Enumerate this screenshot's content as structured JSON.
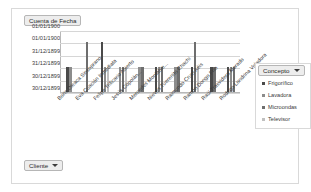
{
  "window": {
    "title_field_label": "Cuenta de Fecha",
    "cliente_field_label": "Cliente",
    "concepto_field_label": "Concepto"
  },
  "legend": {
    "title": "Concepto",
    "items": [
      {
        "label": "Frigorífico",
        "color": "#4a4a4a"
      },
      {
        "label": "Lavadora",
        "color": "#8c8c8c"
      },
      {
        "label": "Microondas",
        "color": "#6e6e6e"
      },
      {
        "label": "Televisor",
        "color": "#c0c0c0"
      }
    ]
  },
  "chart_data": {
    "type": "bar",
    "title": "Cuenta de Fecha",
    "xlabel": "Cliente",
    "ylabel": "Cuenta de Fecha",
    "grid": true,
    "legend_position": "right",
    "ytick_labels": [
      "01/01/1900",
      "01/01/1900",
      "31/12/1899",
      "31/12/1899",
      "30/12/1899",
      "30/12/1899"
    ],
    "ylim": [
      0,
      5
    ],
    "categories": [
      "Boris Oleaca Sinsoprano",
      "Eva Cuación Inmediata",
      "Felipe Trificario Abierto",
      "Jesús Copolán...",
      "Mercedes Montable...",
      "Nieves Tuerenito Chachi",
      "Raimundo Cruel Aéis",
      "Ramón Dongo Frío",
      "Raúl Trasvidera Morado",
      "Rodrigo Londrina Voladora"
    ],
    "series": [
      {
        "name": "Frigorífico",
        "color": "#4a4a4a",
        "values": [
          2,
          0,
          4,
          0,
          0,
          2,
          0,
          2,
          2,
          2
        ]
      },
      {
        "name": "Lavadora",
        "color": "#8c8c8c",
        "values": [
          2,
          0,
          2,
          2,
          2,
          2,
          2,
          0,
          0,
          2
        ]
      },
      {
        "name": "Microondas",
        "color": "#6e6e6e",
        "values": [
          0,
          4,
          0,
          2,
          2,
          2,
          2,
          4,
          2,
          2
        ]
      },
      {
        "name": "Televisor",
        "color": "#c0c0c0",
        "values": [
          0,
          0,
          2,
          2,
          0,
          0,
          0,
          2,
          0,
          0
        ]
      }
    ]
  }
}
